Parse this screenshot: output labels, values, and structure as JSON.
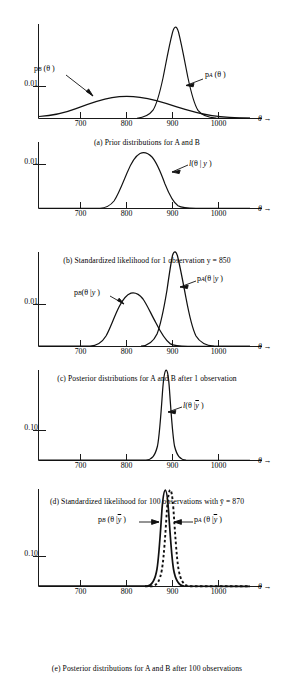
{
  "figure": {
    "axis_label_theta": "θ →",
    "x_ticks": [
      700,
      800,
      900,
      1000
    ],
    "x_tick_labels": [
      "700",
      "800",
      "900",
      "1000"
    ]
  },
  "panels": [
    {
      "id": "a",
      "caption": "(a) Prior distributions for A and B",
      "y_label": "0.01",
      "curve_labels": [
        {
          "name": "p-b-theta",
          "html": "p<span class=\"sub\"><i>B</i></span> (θ )"
        },
        {
          "name": "p-a-theta",
          "html": "p<span class=\"sub\"><i>A</i></span> (θ )"
        }
      ]
    },
    {
      "id": "b",
      "caption": "(b) Standardized likelihood for 1 observation y = 850",
      "y_label": "0.01",
      "curve_labels": [
        {
          "name": "likelihood-theta-y",
          "html": "<i>l</i>(θ | <i>y</i> )"
        }
      ]
    },
    {
      "id": "c",
      "caption": "(c) Posterior distributions for A and B after 1 observation",
      "y_label": "0.01",
      "curve_labels": [
        {
          "name": "p-b-theta-given-y",
          "html": "p<span class=\"sub\"><i>B</i></span>(θ |<i>y</i> )"
        },
        {
          "name": "p-a-theta-given-y",
          "html": "p<span class=\"sub\"><i>A</i></span>(θ |<i>y</i> )"
        }
      ]
    },
    {
      "id": "d",
      "caption": "(d) Standardized likelihood for 100 observations with ȳ = 870",
      "y_label": "0.10",
      "curve_labels": [
        {
          "name": "likelihood-theta-ybar",
          "html": "<i>l</i>(θ |<span class=\"ovl\"><i>y</i></span> )"
        }
      ]
    },
    {
      "id": "e",
      "caption": "(e) Posterior distributions for A and B after 100 observations",
      "y_label": "0.10",
      "curve_labels": [
        {
          "name": "p-b-theta-given-ybar",
          "html": "p<span class=\"sub\"><i>B</i></span> (θ |<span class=\"ovl\"><i>y</i></span> )"
        },
        {
          "name": "p-a-theta-given-ybar",
          "html": "p<span class=\"sub\"><i>A</i></span> (θ |<span class=\"ovl\"><i>y</i></span> )"
        }
      ]
    }
  ],
  "chart_data": [
    {
      "type": "line",
      "panel": "a",
      "title": "(a) Prior distributions for A and B",
      "xlabel": "θ",
      "ylabel": "density",
      "xlim": [
        620,
        1050
      ],
      "ylim": [
        0,
        0.021
      ],
      "grid": false,
      "yticks": [
        0.01
      ],
      "xticks": [
        700,
        800,
        900,
        1000
      ],
      "series": [
        {
          "name": "p_B(θ)",
          "style": "solid",
          "distribution": "normal-like broad",
          "mean": 805,
          "sd": 78,
          "peak_density": 0.0051
        },
        {
          "name": "p_A(θ)",
          "style": "solid",
          "distribution": "normal",
          "mean": 905,
          "sd": 20,
          "peak_density": 0.0199
        }
      ]
    },
    {
      "type": "line",
      "panel": "b",
      "title": "(b) Standardized likelihood for 1 observation y = 850",
      "xlabel": "θ",
      "ylabel": "density",
      "xlim": [
        620,
        1050
      ],
      "ylim": [
        0,
        0.0135
      ],
      "grid": false,
      "yticks": [
        0.01
      ],
      "xticks": [
        700,
        800,
        900,
        1000
      ],
      "annotations": [
        {
          "text": "y = 850",
          "value": 850
        }
      ],
      "series": [
        {
          "name": "l(θ|y)",
          "style": "solid",
          "distribution": "normal",
          "mean": 850,
          "sd": 33,
          "peak_density": 0.0121
        }
      ]
    },
    {
      "type": "line",
      "panel": "c",
      "title": "(c) Posterior distributions for A and B after 1 observation",
      "xlabel": "θ",
      "ylabel": "density",
      "xlim": [
        620,
        1050
      ],
      "ylim": [
        0,
        0.024
      ],
      "grid": false,
      "yticks": [
        0.01
      ],
      "xticks": [
        700,
        800,
        900,
        1000
      ],
      "series": [
        {
          "name": "p_B(θ|y)",
          "style": "solid",
          "distribution": "normal",
          "mean": 840,
          "sd": 32,
          "peak_density": 0.0125
        },
        {
          "name": "p_A(θ|y)",
          "style": "solid",
          "distribution": "normal",
          "mean": 900,
          "sd": 17,
          "peak_density": 0.0234
        }
      ]
    },
    {
      "type": "line",
      "panel": "d",
      "title": "(d) Standardized likelihood for 100 observations with ȳ = 870",
      "xlabel": "θ",
      "ylabel": "density",
      "xlim": [
        620,
        1050
      ],
      "ylim": [
        0,
        0.22
      ],
      "grid": false,
      "yticks": [
        0.1
      ],
      "xticks": [
        700,
        800,
        900,
        1000
      ],
      "annotations": [
        {
          "text": "ȳ = 870",
          "value": 870
        }
      ],
      "series": [
        {
          "name": "l(θ|ȳ)",
          "style": "solid",
          "distribution": "normal",
          "mean": 872,
          "sd": 9.5,
          "peak_density": 0.21
        }
      ]
    },
    {
      "type": "line",
      "panel": "e",
      "title": "(e) Posterior distributions for A and B after 100 observations",
      "xlabel": "θ",
      "ylabel": "density",
      "xlim": [
        620,
        1050
      ],
      "ylim": [
        0,
        0.23
      ],
      "grid": false,
      "yticks": [
        0.1
      ],
      "xticks": [
        700,
        800,
        900,
        1000
      ],
      "series": [
        {
          "name": "p_B(θ|ȳ)",
          "style": "solid",
          "distribution": "normal",
          "mean": 871,
          "sd": 9.4,
          "peak_density": 0.215
        },
        {
          "name": "p_A(θ|ȳ)",
          "style": "dashed",
          "distribution": "normal",
          "mean": 876,
          "sd": 9.2,
          "peak_density": 0.218
        }
      ]
    }
  ]
}
